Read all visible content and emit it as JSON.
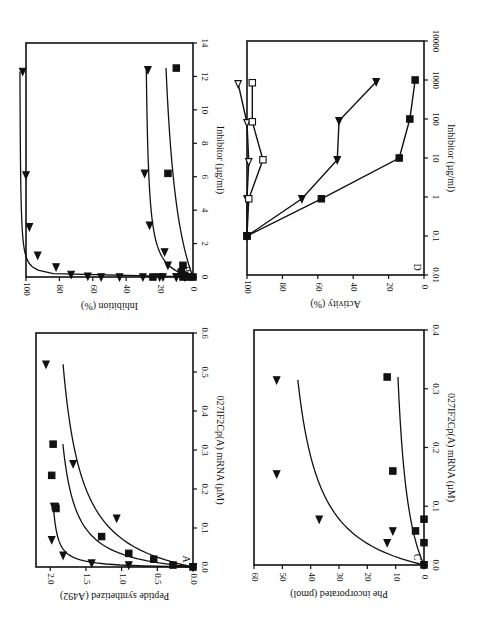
{
  "figure": {
    "orientation": "rotated 180 degrees",
    "panels_order": [
      "A",
      "B",
      "C",
      "D"
    ]
  },
  "chart_data": [
    {
      "panel": "A",
      "type": "scatter",
      "title": "",
      "panel_label": "A",
      "xlabel": "027IF2Cp(A) mRNA (µM)",
      "ylabel": "Peptide synthetized (A492)",
      "xlim": [
        0,
        0.6
      ],
      "ylim": [
        0,
        2.2
      ],
      "xticks": [
        "0.0",
        "0.1",
        "0.2",
        "0.3",
        "0.4",
        "0.5",
        "0.6"
      ],
      "yticks": [
        "0.0",
        "0.5",
        "1.0",
        "1.5",
        "2.0"
      ],
      "grid": false,
      "series": [
        {
          "name": "left-pointing triangles",
          "marker": "triangle-left",
          "points": [
            [
              0.0,
              0.0
            ],
            [
              0.005,
              0.9
            ],
            [
              0.01,
              1.42
            ],
            [
              0.03,
              1.82
            ],
            [
              0.07,
              1.98
            ],
            [
              0.155,
              1.95
            ]
          ]
        },
        {
          "name": "squares",
          "marker": "square",
          "points": [
            [
              0.0,
              0.0
            ],
            [
              0.005,
              0.28
            ],
            [
              0.02,
              0.55
            ],
            [
              0.035,
              0.9
            ],
            [
              0.078,
              1.28
            ],
            [
              0.15,
              1.92
            ],
            [
              0.155,
              1.93
            ],
            [
              0.235,
              1.98
            ],
            [
              0.315,
              1.96
            ]
          ]
        },
        {
          "name": "right-pointing triangles",
          "marker": "triangle-right",
          "points": [
            [
              0.0,
              0.0
            ],
            [
              0.125,
              1.07
            ],
            [
              0.265,
              1.68
            ],
            [
              0.52,
              2.06
            ]
          ]
        }
      ]
    },
    {
      "panel": "B",
      "type": "scatter",
      "title": "",
      "panel_label": "B",
      "xlabel": "Inhibitor (µg/ml)",
      "ylabel": "Inhibition (%)",
      "xlim": [
        0,
        14
      ],
      "ylim": [
        0,
        100
      ],
      "xticks": [
        "0",
        "2",
        "4",
        "6",
        "8",
        "10",
        "12",
        "14"
      ],
      "yticks": [
        "0",
        "20",
        "40",
        "60",
        "80",
        "100"
      ],
      "grid": false,
      "series": [
        {
          "name": "up triangles",
          "marker": "triangle-up",
          "points": [
            [
              0.0,
              10
            ],
            [
              0.0,
              20
            ],
            [
              0.0,
              30
            ],
            [
              0.0,
              44
            ],
            [
              0.0,
              55
            ],
            [
              0.05,
              63
            ],
            [
              0.15,
              73
            ],
            [
              0.6,
              82
            ],
            [
              1.3,
              93
            ],
            [
              3.0,
              98
            ],
            [
              6.1,
              100
            ],
            [
              12.3,
              102
            ]
          ]
        },
        {
          "name": "down triangles",
          "marker": "triangle-down",
          "points": [
            [
              0.0,
              5
            ],
            [
              0.0,
              10
            ],
            [
              0.0,
              18
            ],
            [
              0.7,
              15
            ],
            [
              1.5,
              17
            ],
            [
              3.1,
              26
            ],
            [
              6.2,
              29
            ],
            [
              12.4,
              27
            ]
          ]
        },
        {
          "name": "squares",
          "marker": "square",
          "points": [
            [
              0.0,
              0
            ],
            [
              0.0,
              3
            ],
            [
              0.0,
              6
            ],
            [
              0.0,
              24
            ],
            [
              0.1,
              5
            ],
            [
              0.3,
              7
            ],
            [
              0.7,
              6
            ],
            [
              6.2,
              15
            ],
            [
              12.5,
              10
            ]
          ]
        }
      ]
    },
    {
      "panel": "C",
      "type": "scatter",
      "title": "",
      "panel_label": "C",
      "xlabel": "027IF2Cp(A) mRNA (µM)",
      "ylabel": "Phe incorporated (pmol)",
      "xlim": [
        0,
        0.4
      ],
      "ylim": [
        0,
        60
      ],
      "xticks": [
        "0.0",
        "0.1",
        "0.2",
        "0.3",
        "0.4"
      ],
      "yticks": [
        "0",
        "10",
        "20",
        "30",
        "40",
        "50",
        "60"
      ],
      "grid": false,
      "series": [
        {
          "name": "triangles",
          "marker": "triangle-up",
          "points": [
            [
              0.0,
              0
            ],
            [
              0.038,
              13
            ],
            [
              0.058,
              11
            ],
            [
              0.078,
              37
            ],
            [
              0.155,
              52
            ],
            [
              0.315,
              52
            ]
          ]
        },
        {
          "name": "squares",
          "marker": "square",
          "points": [
            [
              0.0,
              0
            ],
            [
              0.038,
              0
            ],
            [
              0.058,
              3
            ],
            [
              0.078,
              0
            ],
            [
              0.16,
              11
            ],
            [
              0.32,
              13
            ]
          ]
        }
      ]
    },
    {
      "panel": "D",
      "type": "line",
      "title": "",
      "panel_label": "D",
      "xlabel": "Inhibitor (µg/ml)",
      "ylabel": "Activity (%)",
      "xscale": "log",
      "xlim": [
        0.01,
        10000
      ],
      "ylim": [
        0,
        100
      ],
      "xticks": [
        "0.01",
        "0.1",
        "1",
        "10",
        "100",
        "1000",
        "10000"
      ],
      "yticks": [
        "0",
        "20",
        "40",
        "60",
        "80",
        "100"
      ],
      "grid": false,
      "series": [
        {
          "name": "open triangles",
          "marker": "triangle-open",
          "points": [
            [
              0.1,
              100
            ],
            [
              0.9,
              100
            ],
            [
              8,
              99
            ],
            [
              80,
              100
            ],
            [
              800,
              105
            ]
          ]
        },
        {
          "name": "open squares",
          "marker": "square-open",
          "points": [
            [
              0.1,
              100
            ],
            [
              0.9,
              99
            ],
            [
              9,
              91
            ],
            [
              85,
              97
            ],
            [
              850,
              97
            ]
          ]
        },
        {
          "name": "filled triangles",
          "marker": "triangle-filled",
          "points": [
            [
              0.1,
              100
            ],
            [
              0.9,
              69
            ],
            [
              9,
              49
            ],
            [
              90,
              48
            ],
            [
              900,
              27
            ]
          ]
        },
        {
          "name": "filled squares",
          "marker": "square-filled",
          "points": [
            [
              0.1,
              100
            ],
            [
              0.9,
              58
            ],
            [
              10,
              14
            ],
            [
              100,
              8
            ],
            [
              1000,
              5
            ]
          ]
        }
      ]
    }
  ]
}
